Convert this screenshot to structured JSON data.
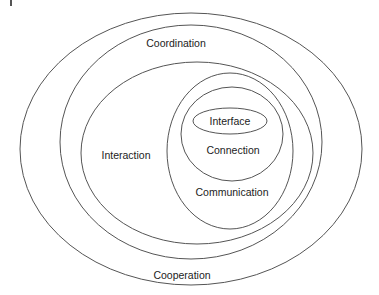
{
  "diagram": {
    "type": "nested-ellipses",
    "line_color": "#555555",
    "text_color": "#222222",
    "ellipses": [
      {
        "label": "Cooperation",
        "cx": 191,
        "cy": 149,
        "rx": 171,
        "ry": 136,
        "label_x": 182,
        "label_y": 275
      },
      {
        "label": "Coordination",
        "cx": 191,
        "cy": 142,
        "rx": 131,
        "ry": 117,
        "label_x": 176,
        "label_y": 43
      },
      {
        "label": "Interaction",
        "cx": 197,
        "cy": 153,
        "rx": 116,
        "ry": 91,
        "label_x": 126,
        "label_y": 155
      },
      {
        "label": "Communication",
        "cx": 230,
        "cy": 151,
        "rx": 63,
        "ry": 78,
        "label_x": 232,
        "label_y": 192
      },
      {
        "label": "Connection",
        "cx": 232,
        "cy": 134,
        "rx": 51,
        "ry": 47,
        "label_x": 233,
        "label_y": 150
      },
      {
        "label": "Interface",
        "cx": 230,
        "cy": 121,
        "rx": 37,
        "ry": 13,
        "label_x": 230,
        "label_y": 121
      }
    ]
  }
}
